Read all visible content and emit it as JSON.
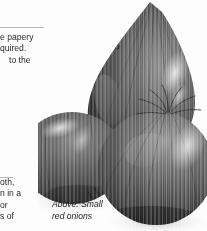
{
  "page": {
    "background_color": "#fdfdfd",
    "text_color": "#2a2a2a",
    "rule_color": "#b9b9b9"
  },
  "article": {
    "heading": "ques",
    "upper_paragraph_lines": [
      "e papery",
      "quired.",
      "to the"
    ],
    "lower_paragraph_lines": [
      "oth,",
      "n in a",
      "or",
      "s of"
    ]
  },
  "photo": {
    "caption_lines": [
      "Above: Small",
      "red onions"
    ],
    "subject": "three red onions",
    "style": "black-and-white halftone photograph",
    "onions": [
      {
        "name": "teardrop-onion-top",
        "note": "tall pointed bulb, centre top"
      },
      {
        "name": "round-onion-left",
        "note": "rounded bulb, middle left"
      },
      {
        "name": "round-onion-bottom-right",
        "note": "largest bulb, lower right with root fibres"
      }
    ],
    "tones": {
      "shadow": "#2f2f2f",
      "midtone": "#6a6a6a",
      "highlight": "#e8e8e8",
      "paper": "#fdfdfd"
    }
  }
}
